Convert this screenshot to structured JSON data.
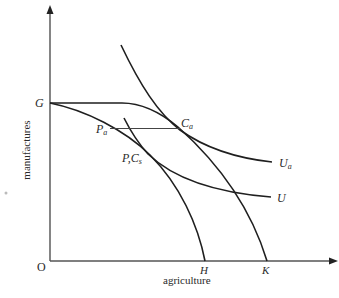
{
  "diagram": {
    "type": "production-possibility and indifference curves",
    "axes": {
      "origin_label": "O",
      "x_label": "agriculture",
      "y_label": "manufactures",
      "x_ticks": [
        "H",
        "K"
      ],
      "y_ticks": [
        "G"
      ]
    },
    "curves": [
      {
        "id": "ppf-inner",
        "from": "G",
        "to": "H"
      },
      {
        "id": "ppf-outer",
        "from": "G",
        "to": "K"
      },
      {
        "id": "indifference-Ua",
        "label": "U",
        "label_sub": "a"
      },
      {
        "id": "indifference-U",
        "label": "U"
      }
    ],
    "points": {
      "G": {
        "main": "G"
      },
      "Pa": {
        "main": "P",
        "sub": "a"
      },
      "Ca": {
        "main": "C",
        "sub": "a"
      },
      "PCs": {
        "main": "P,C",
        "sub": "s"
      }
    },
    "labels": {
      "O": "O",
      "G": "G",
      "H": "H",
      "K": "K",
      "Ua_main": "U",
      "Ua_sub": "a",
      "U": "U",
      "Pa_main": "P",
      "Pa_sub": "a",
      "Ca_main": "C",
      "Ca_sub": "a",
      "PCs_main": "P,C",
      "PCs_sub": "s",
      "x_axis": "agriculture",
      "y_axis": "manufactures"
    },
    "colors": {
      "line": "#1f1f1f",
      "text": "#2a2a2a",
      "background": "#ffffff"
    }
  }
}
